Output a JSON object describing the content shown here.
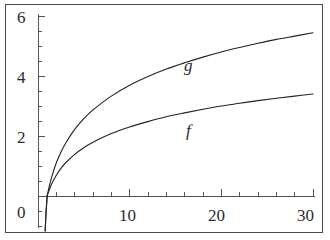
{
  "figure": {
    "background": "#ffffff",
    "frame_color": "#4a4a4a",
    "axis_color": "#555555",
    "curve_color": "#222222"
  },
  "chart_data": {
    "type": "line",
    "title": "",
    "xlabel": "",
    "ylabel": "",
    "xlim": [
      0,
      30
    ],
    "ylim": [
      0,
      6
    ],
    "grid": false,
    "legend": "inline-curve-labels",
    "x_ticks_major": [
      0,
      10,
      20,
      30
    ],
    "x_tick_labels": [
      "0",
      "10",
      "20",
      "30"
    ],
    "x_ticks_minor_step": 2,
    "y_ticks_major": [
      0,
      2,
      4,
      6
    ],
    "y_tick_labels": [
      "0",
      "2",
      "4",
      "6"
    ],
    "y_ticks_minor_step": 0.5,
    "axis_origin_label": "0",
    "series": [
      {
        "name": "g",
        "label": "g",
        "label_x": 17.5,
        "label_y": 4.35,
        "x": [
          1.0,
          1.2,
          1.5,
          2.0,
          2.5,
          3.0,
          4.0,
          5.0,
          6.0,
          8.0,
          10.0,
          12.0,
          14.0,
          16.0,
          18.0,
          20.0,
          22.0,
          24.0,
          26.0,
          28.0,
          30.0
        ],
        "y": [
          0.0,
          0.29,
          0.64,
          1.11,
          1.46,
          1.75,
          2.22,
          2.58,
          2.87,
          3.33,
          3.69,
          3.98,
          4.23,
          4.44,
          4.63,
          4.8,
          4.95,
          5.09,
          5.22,
          5.33,
          5.44
        ]
      },
      {
        "name": "f",
        "label": "f",
        "label_x": 17.6,
        "label_y": 2.45,
        "x": [
          1.0,
          1.2,
          1.5,
          2.0,
          2.5,
          3.0,
          4.0,
          5.0,
          6.0,
          8.0,
          10.0,
          12.0,
          14.0,
          16.0,
          18.0,
          20.0,
          22.0,
          24.0,
          26.0,
          28.0,
          30.0
        ],
        "y": [
          0.0,
          0.18,
          0.41,
          0.69,
          0.92,
          1.1,
          1.39,
          1.61,
          1.79,
          2.08,
          2.3,
          2.48,
          2.64,
          2.77,
          2.89,
          3.0,
          3.09,
          3.18,
          3.26,
          3.33,
          3.4
        ]
      }
    ]
  },
  "labels": {
    "y6": "6",
    "y4": "4",
    "y2": "2",
    "y0": "0",
    "x10": "10",
    "x20": "20",
    "x30": "30",
    "curve_g": "g",
    "curve_f": "f"
  }
}
